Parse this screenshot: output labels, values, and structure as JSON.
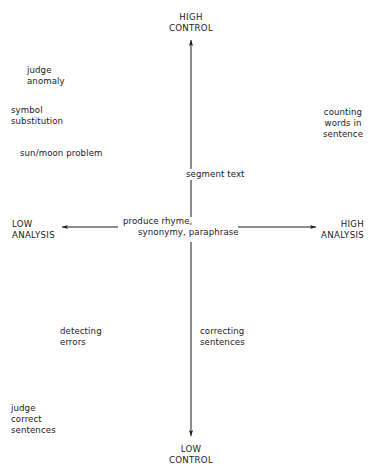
{
  "diagram": {
    "type": "two-axis quadrant diagram",
    "axes": {
      "vertical": {
        "top_label": "HIGH\nCONTROL",
        "bottom_label": "LOW\nCONTROL"
      },
      "horizontal": {
        "left_label": "LOW\nANALYSIS",
        "right_label": "HIGH\nANALYSIS"
      }
    },
    "center_label": {
      "line1": "produce rhyme,",
      "line2": "synonymy, paraphrase"
    },
    "items": [
      {
        "id": "judge-anomaly",
        "text": "judge\nanomaly"
      },
      {
        "id": "symbol-substitution",
        "text": "symbol\nsubstitution"
      },
      {
        "id": "sun-moon-problem",
        "text": "sun/moon problem"
      },
      {
        "id": "counting-words",
        "text": "counting\nwords in\nsentence"
      },
      {
        "id": "segment-text",
        "text": "segment text"
      },
      {
        "id": "detecting-errors",
        "text": "detecting\nerrors"
      },
      {
        "id": "correcting-sentences",
        "text": "correcting\nsentences"
      },
      {
        "id": "judge-correct-sentences",
        "text": "judge\ncorrect\nsentences"
      }
    ],
    "colors": {
      "ink": "#1a1a1a",
      "background": "#ffffff"
    }
  }
}
